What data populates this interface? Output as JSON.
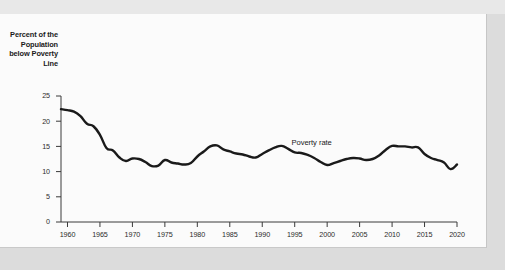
{
  "chart_data": {
    "type": "line",
    "title": "",
    "xlabel": "",
    "ylabel": "Percent of the Population below Poverty Line",
    "ylabel_lines": [
      "Percent of the",
      "Population",
      "below Poverty",
      "Line"
    ],
    "xlim": [
      1959,
      2020
    ],
    "ylim": [
      0,
      25
    ],
    "grid": false,
    "legend_position": "inline-annotation",
    "series_label": "Poverty rate",
    "annotations": [
      {
        "text": "Poverty rate",
        "x": 1994.5,
        "y": 15.6
      }
    ],
    "ytick_labels": [
      "0",
      "5",
      "10",
      "15",
      "20",
      "25"
    ],
    "ytick_values": [
      0,
      5,
      10,
      15,
      20,
      25
    ],
    "xtick_labels": [
      "1960",
      "1965",
      "1970",
      "1975",
      "1980",
      "1985",
      "1990",
      "1995",
      "2000",
      "2005",
      "2010",
      "2015",
      "2020"
    ],
    "xtick_values": [
      1960,
      1965,
      1970,
      1975,
      1980,
      1985,
      1990,
      1995,
      2000,
      2005,
      2010,
      2015,
      2020
    ],
    "series": [
      {
        "name": "Poverty rate",
        "color": "#1a1a1a",
        "x": [
          1959,
          1960,
          1961,
          1962,
          1963,
          1964,
          1965,
          1966,
          1967,
          1968,
          1969,
          1970,
          1971,
          1972,
          1973,
          1974,
          1975,
          1976,
          1977,
          1978,
          1979,
          1980,
          1981,
          1982,
          1983,
          1984,
          1985,
          1986,
          1987,
          1988,
          1989,
          1990,
          1991,
          1992,
          1993,
          1994,
          1995,
          1996,
          1997,
          1998,
          1999,
          2000,
          2001,
          2002,
          2003,
          2004,
          2005,
          2006,
          2007,
          2008,
          2009,
          2010,
          2011,
          2012,
          2013,
          2014,
          2015,
          2016,
          2017,
          2018,
          2019,
          2020
        ],
        "values": [
          22.4,
          22.2,
          21.9,
          21.0,
          19.5,
          19.0,
          17.3,
          14.7,
          14.2,
          12.8,
          12.1,
          12.6,
          12.5,
          11.9,
          11.1,
          11.2,
          12.3,
          11.8,
          11.6,
          11.4,
          11.7,
          13.0,
          14.0,
          15.0,
          15.2,
          14.4,
          14.0,
          13.6,
          13.4,
          13.0,
          12.8,
          13.5,
          14.2,
          14.8,
          15.1,
          14.5,
          13.8,
          13.7,
          13.3,
          12.7,
          11.9,
          11.3,
          11.7,
          12.1,
          12.5,
          12.7,
          12.6,
          12.3,
          12.5,
          13.2,
          14.3,
          15.1,
          15.0,
          15.0,
          14.8,
          14.8,
          13.5,
          12.7,
          12.3,
          11.8,
          10.5,
          11.4
        ]
      }
    ]
  },
  "axis": {
    "title_lines": [
      "Percent of the",
      "Population",
      "below Poverty",
      "Line"
    ]
  }
}
